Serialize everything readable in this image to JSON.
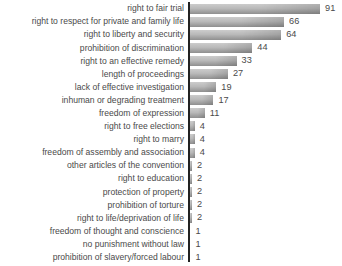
{
  "chart_data": {
    "type": "bar",
    "orientation": "horizontal",
    "title": "",
    "xlabel": "",
    "ylabel": "",
    "categories": [
      "right to fair trial",
      "right to respect for private and family life",
      "right to liberty and security",
      "prohibition of discrimination",
      "right to an effective remedy",
      "length of proceedings",
      "lack of effective investigation",
      "inhuman or degrading treatment",
      "freedom of expression",
      "right to free elections",
      "right to marry",
      "freedom of assembly and association",
      "other articles of the convention",
      "right to education",
      "protection of property",
      "prohibition of torture",
      "right to life/deprivation of life",
      "freedom of thought and conscience",
      "no punishment without law",
      "prohibition of slavery/forced labour"
    ],
    "values": [
      91,
      66,
      64,
      44,
      33,
      27,
      19,
      17,
      11,
      4,
      4,
      4,
      2,
      2,
      2,
      2,
      2,
      1,
      1,
      1
    ],
    "xlim": [
      0,
      106
    ],
    "px_per_unit": 1.44,
    "grid": false,
    "legend": false,
    "value_labels_shown": true,
    "bar_color_top": "#cccccc",
    "bar_color_bottom": "#8f8f8f",
    "axis_color": "#222222",
    "label_color": "#4a4a4a",
    "background_color": "#ffffff"
  }
}
